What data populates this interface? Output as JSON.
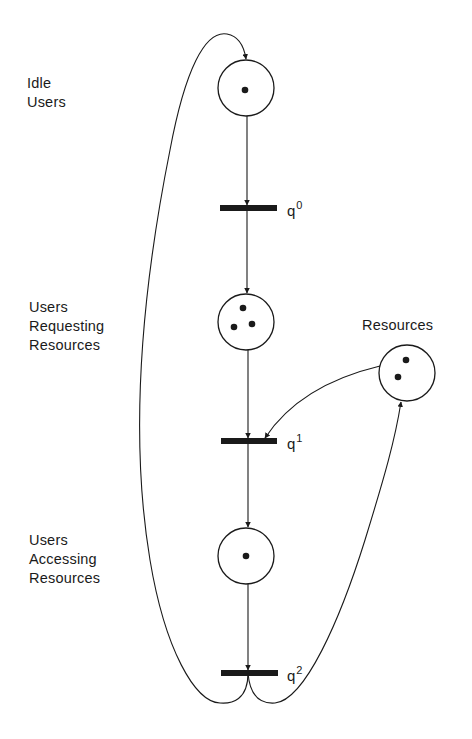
{
  "diagram": {
    "type": "petri-net",
    "places": [
      {
        "id": "idle_users",
        "label_lines": [
          "Idle",
          "Users"
        ],
        "tokens": 1
      },
      {
        "id": "users_requesting",
        "label_lines": [
          "Users",
          "Requesting",
          "Resources"
        ],
        "tokens": 3
      },
      {
        "id": "users_accessing",
        "label_lines": [
          "Users",
          "Accessing",
          "Resources"
        ],
        "tokens": 1
      },
      {
        "id": "resources",
        "label_lines": [
          "Resources"
        ],
        "tokens": 2
      }
    ],
    "transitions": [
      {
        "id": "q0",
        "base": "q",
        "sup": "0"
      },
      {
        "id": "q1",
        "base": "q",
        "sup": "1"
      },
      {
        "id": "q2",
        "base": "q",
        "sup": "2"
      }
    ],
    "arcs": [
      {
        "from": "idle_users",
        "to": "q0"
      },
      {
        "from": "q0",
        "to": "users_requesting"
      },
      {
        "from": "users_requesting",
        "to": "q1"
      },
      {
        "from": "resources",
        "to": "q1"
      },
      {
        "from": "q1",
        "to": "users_accessing"
      },
      {
        "from": "users_accessing",
        "to": "q2"
      },
      {
        "from": "q2",
        "to": "idle_users"
      },
      {
        "from": "q2",
        "to": "resources"
      }
    ],
    "colors": {
      "ink": "#1a1a1a",
      "background": "#ffffff"
    }
  }
}
